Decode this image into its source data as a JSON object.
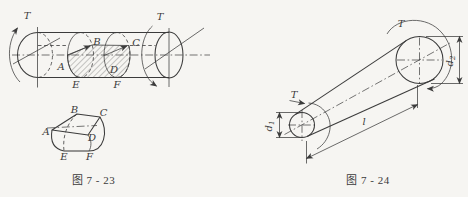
{
  "colors": {
    "bg": "#f6f5f2",
    "line": "#3b3b3b"
  },
  "figure_left": {
    "caption": "图 7 - 23",
    "torque_left": "T",
    "torque_right": "T",
    "points": {
      "A": "A",
      "B": "B",
      "C": "C",
      "D": "D",
      "E": "E",
      "F": "F"
    }
  },
  "figure_right": {
    "caption": "图 7 - 24",
    "torque_small_end": "T",
    "torque_large_end": "T",
    "dim_d1": {
      "base": "d",
      "sub": "1"
    },
    "dim_d2": {
      "base": "d",
      "sub": "2"
    },
    "dim_length": "l"
  }
}
